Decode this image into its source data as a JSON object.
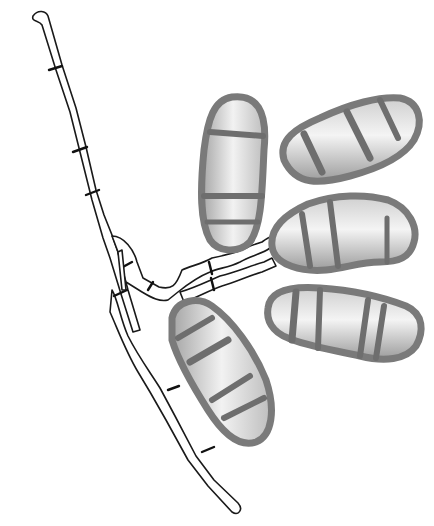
{
  "figure": {
    "colors": {
      "background": "#ffffff",
      "outline": "#1a1a1a",
      "conidium_fill_light": "#f2f2f2",
      "conidium_fill_dark": "#a8a8a8",
      "conidium_wall": "#6e6e6e"
    },
    "conidia": [
      {
        "id": "upper-left",
        "septa": 3
      },
      {
        "id": "upper-right",
        "septa": 3
      },
      {
        "id": "middle-right",
        "septa": 3
      },
      {
        "id": "lower-right",
        "septa": 4
      },
      {
        "id": "lower-left",
        "septa": 4
      }
    ]
  }
}
